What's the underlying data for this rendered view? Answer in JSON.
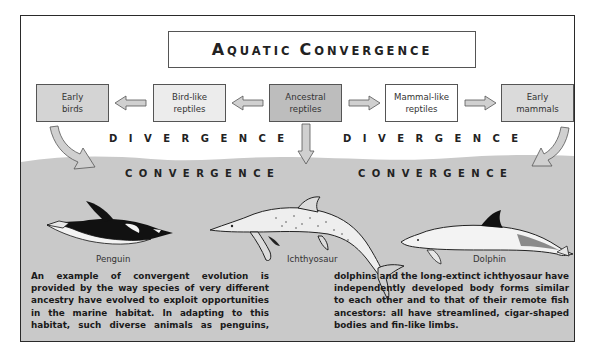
{
  "title": {
    "text": "Aquatic Convergence",
    "word1_cap": "A",
    "word1_rest": "QUATIC",
    "word2_cap": "C",
    "word2_rest": "ONVERGENCE"
  },
  "lineage": {
    "boxes": [
      {
        "id": "early-birds",
        "line1": "Early",
        "line2": "birds",
        "fill": "#d4d4d4"
      },
      {
        "id": "bird-like-reptiles",
        "line1": "Bird-like",
        "line2": "reptiles",
        "fill": "#ececec"
      },
      {
        "id": "ancestral-reptiles",
        "line1": "Ancestral",
        "line2": "reptiles",
        "fill": "#bdbdbd"
      },
      {
        "id": "mammal-like-reptiles",
        "line1": "Mammal-like",
        "line2": "reptiles",
        "fill": "#ffffff"
      },
      {
        "id": "early-mammals",
        "line1": "Early",
        "line2": "mammals",
        "fill": "#dadada"
      }
    ]
  },
  "labels": {
    "divergence_left": "D I V E R G E N C E",
    "divergence_right": "D I V E R G E N C E",
    "convergence_left": "C O N V E R G E N C E",
    "convergence_right": "C O N V E R G E N C E"
  },
  "animals": [
    {
      "id": "penguin",
      "name": "Penguin"
    },
    {
      "id": "ichthyosaur",
      "name": "Ichthyosaur"
    },
    {
      "id": "dolphin",
      "name": "Dolphin"
    }
  ],
  "caption": {
    "left": "An example of convergent evolution is provided by the way species of very different ancestry have evolved to exploit opportunities in the marine habitat. In adapting to this habitat, such diverse animals as penguins,",
    "right": "dolphins and the long-extinct ichthyosaur have independently developed body forms similar to each other and to that of their remote fish ancestors: all have streamlined, cigar-shaped bodies and fin-like limbs."
  },
  "colors": {
    "water": "#c9c9c9",
    "frame": "#2a2a2a",
    "arrow_fill": "#d0d0d0",
    "arrow_stroke": "#555555"
  }
}
